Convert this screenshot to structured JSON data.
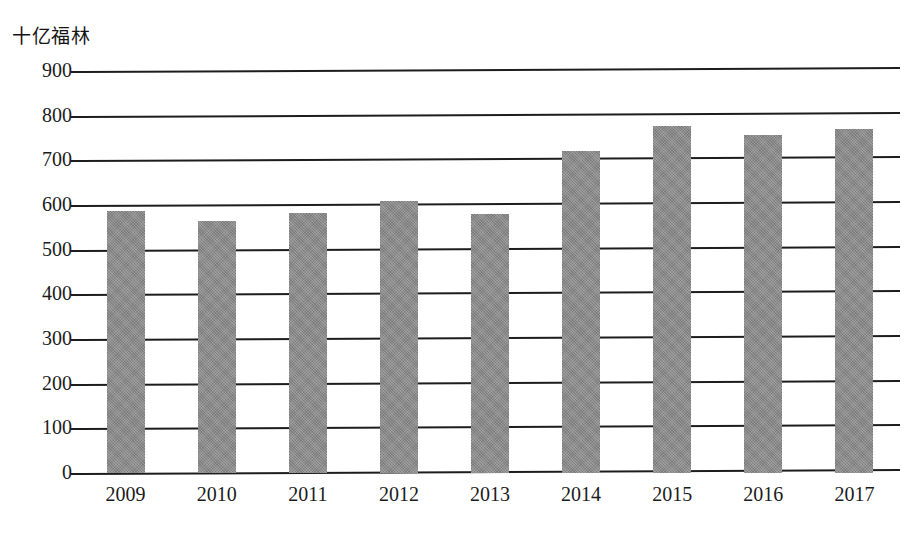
{
  "chart_data": {
    "type": "bar",
    "title": "",
    "unit_label": "十亿福林",
    "xlabel": "",
    "ylabel": "十亿福林",
    "categories": [
      "2009",
      "2010",
      "2011",
      "2012",
      "2013",
      "2014",
      "2015",
      "2016",
      "2017"
    ],
    "values": [
      586,
      564,
      582,
      608,
      581,
      722,
      778,
      757,
      771
    ],
    "ylim": [
      0,
      900
    ],
    "ytick_labels": [
      "900",
      "800",
      "700",
      "600",
      "500",
      "400",
      "300",
      "200",
      "100",
      "0"
    ],
    "ytick_values": [
      900,
      800,
      700,
      600,
      500,
      400,
      300,
      200,
      100,
      0
    ],
    "ytick_step": 100,
    "grid": true,
    "legend": "none",
    "series": [
      {
        "name": "十亿福林",
        "color": "#8b8b8b",
        "values": [
          586,
          564,
          582,
          608,
          581,
          722,
          778,
          757,
          771
        ]
      }
    ],
    "colors": {
      "bar_fill": "#8b8b8b",
      "gridline": "#1d1d1d",
      "text": "#1b1b1b",
      "background": "#ffffff"
    }
  }
}
